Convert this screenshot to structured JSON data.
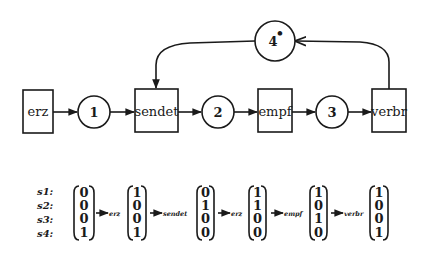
{
  "diagram": {
    "type": "petri-net",
    "transitions": [
      {
        "id": "erz",
        "label": "erz"
      },
      {
        "id": "sendet",
        "label": "sendet"
      },
      {
        "id": "empf",
        "label": "empf"
      },
      {
        "id": "verbr",
        "label": "verbr"
      }
    ],
    "places": [
      {
        "id": "p1",
        "label": "1"
      },
      {
        "id": "p2",
        "label": "2"
      },
      {
        "id": "p3",
        "label": "3"
      },
      {
        "id": "p4",
        "label": "4",
        "token_mark": "•"
      }
    ],
    "arcs": [
      {
        "from": "erz",
        "to": "p1"
      },
      {
        "from": "p1",
        "to": "sendet"
      },
      {
        "from": "sendet",
        "to": "p2"
      },
      {
        "from": "p2",
        "to": "empf"
      },
      {
        "from": "empf",
        "to": "p3"
      },
      {
        "from": "p3",
        "to": "verbr"
      },
      {
        "from": "verbr",
        "to": "p4"
      },
      {
        "from": "p4",
        "to": "sendet"
      }
    ]
  },
  "state_sequence": {
    "row_labels": [
      "s1:",
      "s2:",
      "s3:",
      "s4:"
    ],
    "vectors": [
      [
        "0",
        "0",
        "0",
        "1"
      ],
      [
        "1",
        "0",
        "0",
        "1"
      ],
      [
        "0",
        "1",
        "0",
        "0"
      ],
      [
        "1",
        "1",
        "0",
        "0"
      ],
      [
        "1",
        "0",
        "1",
        "0"
      ],
      [
        "1",
        "0",
        "0",
        "1"
      ]
    ],
    "transitions": [
      "erz",
      "sendet",
      "erz",
      "empf",
      "verbr"
    ]
  },
  "colors": {
    "ink": "#1a1a1a",
    "background": "#ffffff"
  }
}
